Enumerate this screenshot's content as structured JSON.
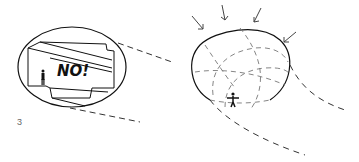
{
  "figure": {
    "number": "3",
    "left_panel": {
      "annotation": "NO!",
      "description": "enclosed box-like space with stepped walls inside an ellipse, small human figure"
    },
    "right_panel": {
      "description": "dome-shaped enclosure with dashed curved gridlines, arrows pointing inward, human figure with outstretched arms"
    }
  },
  "colors": {
    "ink": "#111111",
    "dash": "#444444",
    "label": "#666666"
  }
}
